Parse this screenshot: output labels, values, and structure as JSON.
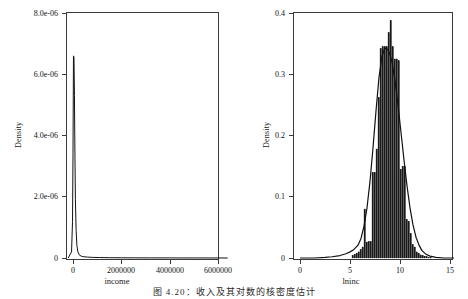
{
  "figure": {
    "caption": "图 4.20：收入及其对数的核密度估计"
  },
  "chart_data": [
    {
      "id": "income-density",
      "type": "line",
      "title": "",
      "xlabel": "income",
      "ylabel": "Density",
      "xlim": [
        -300000,
        6500000
      ],
      "ylim": [
        0,
        8.3e-06
      ],
      "xticks": [
        0,
        2000000,
        4000000,
        6000000
      ],
      "xticklabels": [
        "0",
        "2000000",
        "4000000",
        "6000000"
      ],
      "yticks": [
        0,
        2e-06,
        4e-06,
        6e-06,
        8e-06
      ],
      "yticklabels": [
        "0",
        "2.0e-06",
        "4.0e-06",
        "6.0e-06",
        "8.0e-06"
      ],
      "grid": false,
      "legend": "none",
      "series": [
        {
          "name": "kernel density of income",
          "x": [
            -200000,
            -60000,
            -20000,
            0,
            20000,
            40000,
            60000,
            80000,
            100000,
            130000,
            160000,
            200000,
            260000,
            340000,
            450000,
            600000,
            800000,
            1100000,
            1500000,
            2000000,
            2600000,
            3200000,
            4000000,
            5000000,
            6000000,
            6400000
          ],
          "y": [
            0.0,
            2e-07,
            1.2e-06,
            3.4e-06,
            6.6e-06,
            6.55e-06,
            5.3e-06,
            3.4e-06,
            1.9e-06,
            9e-07,
            4.2e-07,
            2e-07,
            1e-07,
            6e-08,
            4e-08,
            3e-08,
            2e-08,
            1.4e-08,
            1e-08,
            7e-09,
            5e-09,
            4e-09,
            3e-09,
            2e-09,
            1e-09,
            0.0
          ]
        }
      ]
    },
    {
      "id": "lninc-density",
      "type": "bar",
      "title": "",
      "xlabel": "lninc",
      "ylabel": "Density",
      "xlim": [
        -0.6,
        15.6
      ],
      "ylim": [
        0,
        0.405
      ],
      "xticks": [
        0,
        5,
        10,
        15
      ],
      "xticklabels": [
        "0",
        "5",
        "10",
        "15"
      ],
      "yticks": [
        0,
        0.1,
        0.2,
        0.3,
        0.4
      ],
      "yticklabels": [
        "0",
        "0.1",
        "0.2",
        "0.3",
        "0.4"
      ],
      "grid": false,
      "legend": "none",
      "bin_width": 0.2,
      "bin_centers": [
        5.3,
        5.5,
        5.7,
        5.9,
        6.1,
        6.3,
        6.5,
        6.7,
        6.9,
        7.1,
        7.3,
        7.5,
        7.7,
        7.9,
        8.1,
        8.3,
        8.5,
        8.7,
        8.9,
        9.1,
        9.3,
        9.5,
        9.7,
        9.9,
        10.1,
        10.3,
        10.5,
        10.7,
        10.9,
        11.1,
        11.3,
        11.5,
        11.7,
        11.9,
        12.1,
        12.3,
        12.5,
        12.7,
        12.9,
        13.1
      ],
      "bar_values": [
        0.004,
        0.006,
        0.008,
        0.01,
        0.014,
        0.018,
        0.08,
        0.026,
        0.027,
        0.027,
        0.14,
        0.14,
        0.178,
        0.262,
        0.342,
        0.345,
        0.345,
        0.345,
        0.368,
        0.388,
        0.345,
        0.325,
        0.325,
        0.322,
        0.145,
        0.15,
        0.15,
        0.063,
        0.06,
        0.04,
        0.022,
        0.018,
        0.01,
        0.008,
        0.005,
        0.004,
        0.003,
        0.002,
        0.001,
        0.001
      ],
      "overlay_curve": {
        "name": "kernel density of lninc",
        "x": [
          0.0,
          1.5,
          2.5,
          3.2,
          4.0,
          4.6,
          5.0,
          5.4,
          5.8,
          6.1,
          6.4,
          6.7,
          7.0,
          7.3,
          7.6,
          7.9,
          8.2,
          8.5,
          8.8,
          9.0,
          9.2,
          9.5,
          9.8,
          10.1,
          10.4,
          10.7,
          11.0,
          11.3,
          11.6,
          11.9,
          12.2,
          12.6,
          13.0,
          13.6,
          14.4,
          15.4
        ],
        "y": [
          0.0,
          0.0,
          0.001,
          0.002,
          0.004,
          0.007,
          0.01,
          0.014,
          0.021,
          0.032,
          0.052,
          0.082,
          0.125,
          0.18,
          0.24,
          0.295,
          0.33,
          0.343,
          0.34,
          0.332,
          0.32,
          0.29,
          0.25,
          0.205,
          0.16,
          0.118,
          0.082,
          0.054,
          0.034,
          0.021,
          0.012,
          0.006,
          0.003,
          0.001,
          0.0,
          0.0
        ]
      }
    }
  ],
  "panels": {
    "left": {
      "ylabel": "Density",
      "xlabel": "income",
      "yticklabels": [
        "8.0e-06",
        "6.0e-06",
        "4.0e-06",
        "2.0e-06",
        "0"
      ],
      "xticklabels": [
        "0",
        "2000000",
        "4000000",
        "6000000"
      ]
    },
    "right": {
      "ylabel": "Density",
      "xlabel": "lninc",
      "yticklabels": [
        "0.4",
        "0.3",
        "0.2",
        "0.1",
        "0"
      ],
      "xticklabels": [
        "0",
        "5",
        "10",
        "15"
      ]
    }
  },
  "colors": {
    "axis": "#3a3a3a",
    "bar_fill": "#1a1a1a",
    "curve": "#111111",
    "background": "#ffffff"
  }
}
